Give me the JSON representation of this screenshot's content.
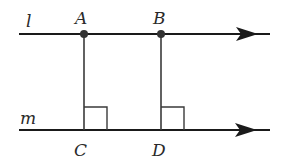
{
  "diagram": {
    "lines": [
      {
        "name": "l",
        "label": "l",
        "y": 34
      },
      {
        "name": "m",
        "label": "m",
        "y": 130
      }
    ],
    "points": [
      {
        "name": "A",
        "label": "A",
        "x": 84,
        "y": 34,
        "dot": true
      },
      {
        "name": "B",
        "label": "B",
        "x": 161,
        "y": 34,
        "dot": true
      },
      {
        "name": "C",
        "label": "C",
        "x": 84,
        "y": 130,
        "dot": false
      },
      {
        "name": "D",
        "label": "D",
        "x": 161,
        "y": 130,
        "dot": false
      }
    ],
    "segments": [
      "AC",
      "BD"
    ],
    "right_angles": [
      "C",
      "D"
    ],
    "colors": {
      "stroke": "#1a1a1a",
      "label": "#2a2a2a"
    }
  }
}
